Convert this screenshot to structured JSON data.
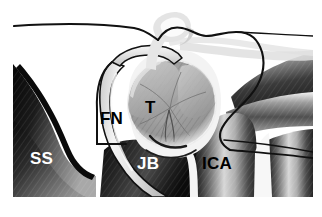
{
  "figure": {
    "background_color": "#ffffff",
    "width": 322,
    "height": 217
  },
  "labels": [
    {
      "id": "ss",
      "text": "SS",
      "meaning": "sigmoid-sinus",
      "color": "#ffffff",
      "x": 30,
      "y": 150
    },
    {
      "id": "fn",
      "text": "FN",
      "meaning": "facial-nerve",
      "color": "#000000",
      "x": 100,
      "y": 110
    },
    {
      "id": "t",
      "text": "T",
      "meaning": "tumor",
      "color": "#000000",
      "x": 145,
      "y": 99
    },
    {
      "id": "jb",
      "text": "JB",
      "meaning": "jugular-bulb",
      "color": "#ffffff",
      "x": 137,
      "y": 155
    },
    {
      "id": "ica",
      "text": "ICA",
      "meaning": "internal-carotid-artery",
      "color": "#000000",
      "x": 202,
      "y": 155
    }
  ],
  "structures": [
    {
      "name": "sigmoid-sinus",
      "tone": "dark-gradient",
      "fill": "#1a1a1a"
    },
    {
      "name": "jugular-bulb",
      "tone": "dark-gradient",
      "fill": "#2a2a2a"
    },
    {
      "name": "internal-carotid-artery",
      "tone": "light-gradient",
      "fill": "#9a9a9a"
    },
    {
      "name": "facial-nerve",
      "tone": "pale-tube",
      "fill": "#e4e4e4"
    },
    {
      "name": "tumor",
      "tone": "mid-gray-hatch",
      "fill": "#9e9e9e"
    },
    {
      "name": "upper-nerve-loop",
      "tone": "pale-tube",
      "fill": "#ececec"
    },
    {
      "name": "outline-contour",
      "tone": "black-line",
      "fill": "#000000"
    }
  ],
  "colors": {
    "outline": "#111111",
    "tumor_fill": "#9e9e9e",
    "tumor_rim": "#f0f0f0",
    "nerve_pale": "#e6e6e6",
    "dark_tissue": "#141414",
    "mid_tissue": "#8d8d8d",
    "white": "#ffffff"
  }
}
